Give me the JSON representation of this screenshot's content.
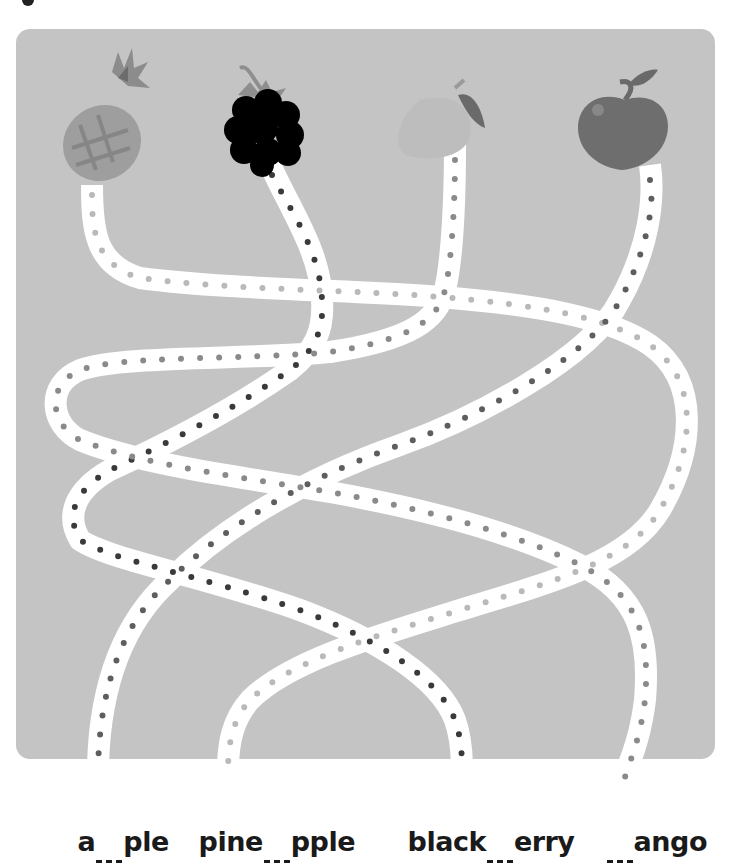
{
  "worksheet": {
    "title_fragment": "g",
    "board_color": "#c4c4c4",
    "path_color": "#ffffff",
    "fruits": [
      {
        "name": "pineapple",
        "x": 105,
        "y": 140
      },
      {
        "name": "blackberry",
        "x": 263,
        "y": 127
      },
      {
        "name": "mango",
        "x": 430,
        "y": 125
      },
      {
        "name": "apple",
        "x": 622,
        "y": 120
      }
    ],
    "paths": [
      {
        "fruit": "pineapple",
        "dot_color": "#b9b9b9",
        "ends_at_word": "pine_pple"
      },
      {
        "fruit": "blackberry",
        "dot_color": "#3a3a3a",
        "ends_at_word": "black_erry"
      },
      {
        "fruit": "mango",
        "dot_color": "#8a8a8a",
        "ends_at_word": "_ango"
      },
      {
        "fruit": "apple",
        "dot_color": "#5e5e5e",
        "ends_at_word": "a_ple"
      }
    ],
    "words": [
      {
        "before": "a",
        "after": "ple",
        "full": "a___ple"
      },
      {
        "before": "pine",
        "after": "pple",
        "full": "pine___pple"
      },
      {
        "before": "black",
        "after": "erry",
        "full": "black___erry"
      },
      {
        "before": "",
        "after": "ango",
        "full": "___ango"
      }
    ]
  }
}
